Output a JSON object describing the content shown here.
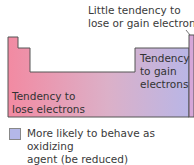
{
  "callout": {
    "line1": "Little tendency to",
    "line2": "lose or gain electrons"
  },
  "regions": {
    "lose": {
      "line1": "Tendency to",
      "line2": "lose electrons",
      "color": "#f08aa0"
    },
    "gain": {
      "line1": "Tendency",
      "line2": "to gain",
      "line3": "electrons",
      "color": "#b8b6e4"
    },
    "noble": {
      "color": "#d8a8d8"
    }
  },
  "legend": {
    "items": [
      {
        "text_line1": "More likely to behave as oxidizing",
        "text_line2": "agent (be reduced)",
        "swatch_color": "#b4b8e8"
      },
      {
        "text_line1": "",
        "text_line2": "",
        "swatch_color": "#c86b88"
      }
    ]
  }
}
